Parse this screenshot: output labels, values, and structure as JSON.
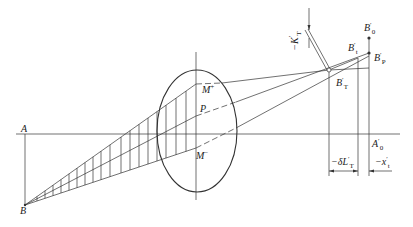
{
  "diagram": {
    "type": "optics-ray-diagram",
    "colors": {
      "stroke": "#333333",
      "background": "#ffffff"
    },
    "labels": {
      "A": "A",
      "B": "B",
      "M_plus": "M",
      "M_plus_sup": "+",
      "P": "P",
      "M_minus": "M",
      "M_minus_sup": "−",
      "A0_prime": "A",
      "A0_prime_sub": "0",
      "B0_prime": "B",
      "B0_prime_sub": "0",
      "Bt_prime": "B",
      "Bt_prime_sub": "t",
      "Bp_prime": "B",
      "Bp_prime_sub": "P",
      "BT_prime": "B",
      "BT_prime_sub": "T",
      "K_T_prime": "−K",
      "K_T_prime_sub": "T",
      "delta_L_T": "−δL",
      "delta_L_T_sub": "T",
      "x_t": "−x",
      "x_t_sub": "t",
      "prime": "′"
    }
  }
}
